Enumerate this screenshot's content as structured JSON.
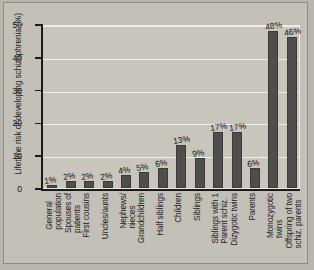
{
  "chart_data": {
    "type": "bar",
    "title": "",
    "xlabel": "",
    "ylabel": "Lifetime risk of  developing schizophrenia (%)",
    "ylim": [
      0,
      50
    ],
    "yticks": [
      0,
      10,
      20,
      30,
      40,
      50
    ],
    "grid": true,
    "legend": null,
    "bar_color": "#4e4e4c",
    "plot_background": "#c8c5bd",
    "figure_background": "#c3c0b8",
    "categories": [
      "General population",
      "Spouses of patients",
      "First cousins",
      "Uncles/aunts",
      "Nephews/ nieces",
      "Grandchildren",
      "Half siblings",
      "Children",
      "Siblings",
      "Siblings with 1 Parent schiz.",
      "Dizygotic twins",
      "Parents",
      "Monozygotic twins",
      "Offspring of two schiz. parents"
    ],
    "category_lines": [
      [
        "General",
        "population"
      ],
      [
        "Spouses of",
        "patients"
      ],
      [
        "First cousins"
      ],
      [
        "Uncles/aunts"
      ],
      [
        "Nephews/",
        "nieces"
      ],
      [
        "Grandchildren"
      ],
      [
        "Half siblings"
      ],
      [
        "Children"
      ],
      [
        "Siblings"
      ],
      [
        "Siblings with 1",
        "Parent schiz."
      ],
      [
        "Dizygotic twins"
      ],
      [
        "Parents"
      ],
      [
        "Monozygotic",
        "twins"
      ],
      [
        "Offspring of two",
        "schiz. parents"
      ]
    ],
    "values": [
      1,
      2,
      2,
      2,
      4,
      5,
      6,
      13,
      9,
      17,
      17,
      6,
      48,
      46
    ],
    "value_labels": [
      "1%",
      "2%",
      "2%",
      "2%",
      "4%",
      "5%",
      "6%",
      "13%",
      "9%",
      "17%",
      "17%",
      "6%",
      "48%",
      "46%"
    ]
  }
}
